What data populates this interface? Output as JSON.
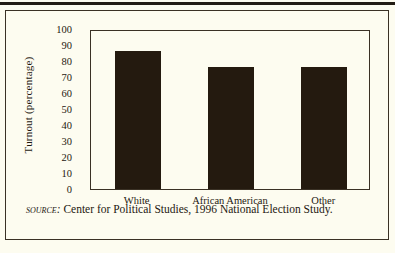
{
  "figure": {
    "source_label": "Source:",
    "source_text": "Center for Political Studies, 1996 National Election Study."
  },
  "colors": {
    "background": "#fdfcf0",
    "bar": "#241a0f",
    "ink": "#1d1810",
    "rule": "#221c14"
  },
  "chart_data": {
    "type": "bar",
    "title": "",
    "xlabel": "",
    "ylabel": "Turnout (percentage)",
    "categories": [
      "White",
      "African American",
      "Other"
    ],
    "values": [
      86,
      76,
      76
    ],
    "ylim": [
      0,
      100
    ],
    "yticks": [
      0,
      10,
      20,
      30,
      40,
      50,
      60,
      70,
      80,
      90,
      100
    ],
    "ytick_labels": [
      "0",
      "10",
      "20",
      "30",
      "40",
      "50",
      "60",
      "70",
      "80",
      "90",
      "100"
    ],
    "grid": false,
    "legend": false
  }
}
